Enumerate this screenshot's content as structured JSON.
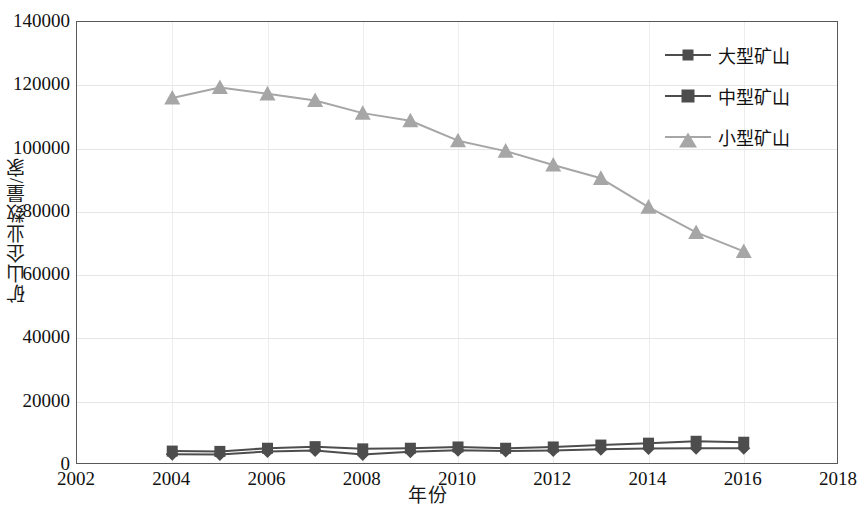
{
  "chart_data": {
    "type": "line",
    "title": "",
    "xlabel": "年份",
    "ylabel": "矿山企业数量/家",
    "x": [
      2004,
      2005,
      2006,
      2007,
      2008,
      2009,
      2010,
      2011,
      2012,
      2013,
      2014,
      2015,
      2016
    ],
    "xlim": [
      2002,
      2018
    ],
    "ylim": [
      0,
      140000
    ],
    "xticks": [
      "2002",
      "2004",
      "2006",
      "2008",
      "2010",
      "2012",
      "2014",
      "2016",
      "2018"
    ],
    "xtick_values": [
      2002,
      2004,
      2006,
      2008,
      2010,
      2012,
      2014,
      2016,
      2018
    ],
    "yticks": [
      "0",
      "20000",
      "40000",
      "60000",
      "80000",
      "100000",
      "120000",
      "140000"
    ],
    "ytick_values": [
      0,
      20000,
      40000,
      60000,
      80000,
      100000,
      120000,
      140000
    ],
    "grid": true,
    "legend_position": "top-right",
    "series": [
      {
        "name": "大型矿山",
        "marker": "diamond",
        "color": "#4d4d4d",
        "values": [
          3400,
          3300,
          4300,
          4600,
          3300,
          4200,
          4700,
          4400,
          4600,
          5000,
          5200,
          5300,
          5300
        ]
      },
      {
        "name": "中型矿山",
        "marker": "square",
        "color": "#4d4d4d",
        "values": [
          4400,
          4300,
          5300,
          5800,
          5100,
          5300,
          5700,
          5300,
          5700,
          6300,
          6900,
          7500,
          7200
        ]
      },
      {
        "name": "小型矿山",
        "marker": "triangle",
        "color": "#a6a6a6",
        "values": [
          116000,
          119300,
          117300,
          115200,
          111200,
          108800,
          102500,
          99200,
          94800,
          90600,
          81500,
          73500,
          67500
        ]
      }
    ]
  }
}
